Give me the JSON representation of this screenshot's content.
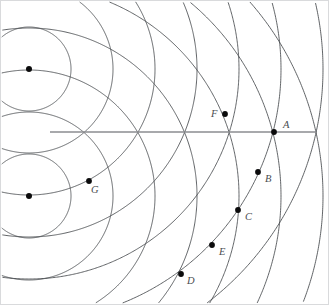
{
  "figure": {
    "width": 329,
    "height": 305,
    "background_color": "#ffffff",
    "frame_color": "#d9dadc",
    "arc_color": "#45484c",
    "axis_color": "#8b8d90",
    "dot_color": "#0b0b0c",
    "label_color": "#4a4d50"
  },
  "sources": [
    {
      "name": "upper-source",
      "x": 29,
      "y": 69,
      "radius": 3.0,
      "label": ""
    },
    {
      "name": "lower-source",
      "x": 29,
      "y": 196,
      "radius": 3.0,
      "label": ""
    }
  ],
  "wavefronts": {
    "description": "Concentric circular wavefronts emitted from each of the two point sources",
    "wavelength": 42,
    "upper_radii": [
      42,
      84,
      126,
      168,
      210,
      252,
      294
    ],
    "lower_radii": [
      42,
      84,
      126,
      168,
      210,
      252,
      294
    ]
  },
  "axis": {
    "name": "central-axis",
    "x1": 50,
    "y1": 132,
    "x2": 316,
    "y2": 132,
    "crossings_x": [
      83,
      138,
      185,
      230,
      275
    ]
  },
  "labeled_points": [
    {
      "id": "A",
      "label": "A",
      "dot_x": 274,
      "dot_y": 132,
      "label_x": 283,
      "label_y": 120
    },
    {
      "id": "B",
      "label": "B",
      "dot_x": 258,
      "dot_y": 172,
      "label_x": 265,
      "label_y": 174
    },
    {
      "id": "C",
      "label": "C",
      "dot_x": 238,
      "dot_y": 210,
      "label_x": 245,
      "label_y": 212
    },
    {
      "id": "D",
      "label": "D",
      "dot_x": 181,
      "dot_y": 274,
      "label_x": 187,
      "label_y": 276
    },
    {
      "id": "E",
      "label": "E",
      "dot_x": 212,
      "dot_y": 245,
      "label_x": 219,
      "label_y": 247
    },
    {
      "id": "F",
      "label": "F",
      "dot_x": 225,
      "dot_y": 114,
      "label_x": 211,
      "label_y": 109
    },
    {
      "id": "G",
      "label": "G",
      "dot_x": 89,
      "dot_y": 181,
      "label_x": 91,
      "label_y": 185
    }
  ]
}
